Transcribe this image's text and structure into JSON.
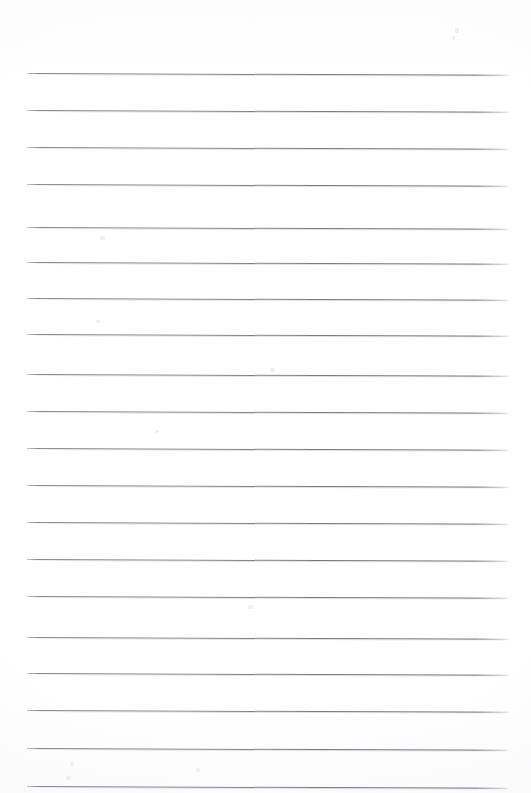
{
  "document": {
    "kind": "scanned-lined-paper",
    "title": "Blank lined notepad page",
    "page_width": 531,
    "page_height": 793,
    "paper_color": "#ffffff",
    "rule_color": "#7c7e82",
    "rule_thickness": 1,
    "content_text": "",
    "handwriting": "none",
    "visible_text": []
  },
  "ruling": {
    "line_count": 20,
    "spacing": 37,
    "left_x": 27,
    "right_x": 510,
    "first_line_y": 73,
    "last_line_y": 748,
    "slant_degrees": 0.22,
    "lines": [
      {
        "index": 1,
        "y": 73
      },
      {
        "index": 2,
        "y": 110
      },
      {
        "index": 3,
        "y": 147
      },
      {
        "index": 4,
        "y": 184
      },
      {
        "index": 5,
        "y": 227
      },
      {
        "index": 6,
        "y": 262
      },
      {
        "index": 7,
        "y": 298
      },
      {
        "index": 8,
        "y": 334
      },
      {
        "index": 9,
        "y": 374
      },
      {
        "index": 10,
        "y": 411
      },
      {
        "index": 11,
        "y": 448
      },
      {
        "index": 12,
        "y": 485
      },
      {
        "index": 13,
        "y": 522
      },
      {
        "index": 14,
        "y": 559
      },
      {
        "index": 15,
        "y": 596
      },
      {
        "index": 16,
        "y": 637
      },
      {
        "index": 17,
        "y": 673
      },
      {
        "index": 18,
        "y": 710
      },
      {
        "index": 19,
        "y": 748
      },
      {
        "index": 20,
        "y": 786
      }
    ]
  },
  "margins": {
    "top": 73,
    "bottom": 45,
    "left": 27,
    "right": 21
  },
  "specks": [
    {
      "x": 455,
      "y": 28,
      "w": 4,
      "h": 5
    },
    {
      "x": 452,
      "y": 36,
      "w": 3,
      "h": 4
    },
    {
      "x": 100,
      "y": 236,
      "w": 5,
      "h": 4
    },
    {
      "x": 96,
      "y": 320,
      "w": 4,
      "h": 3
    },
    {
      "x": 270,
      "y": 368,
      "w": 5,
      "h": 4
    },
    {
      "x": 155,
      "y": 430,
      "w": 4,
      "h": 3
    },
    {
      "x": 248,
      "y": 605,
      "w": 5,
      "h": 4
    },
    {
      "x": 66,
      "y": 776,
      "w": 5,
      "h": 4
    },
    {
      "x": 70,
      "y": 762,
      "w": 4,
      "h": 4
    },
    {
      "x": 196,
      "y": 768,
      "w": 4,
      "h": 4
    }
  ]
}
